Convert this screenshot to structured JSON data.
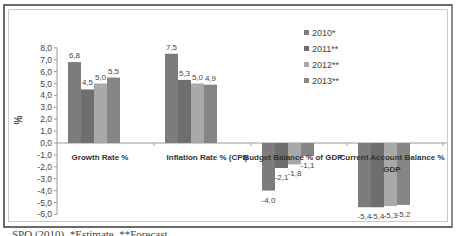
{
  "chart_data": {
    "type": "bar",
    "title": "",
    "xlabel": "",
    "ylabel": "%",
    "ylim": [
      -6.0,
      8.0
    ],
    "y_ticks": [
      "8,0",
      "7,0",
      "6,0",
      "5,0",
      "4,0",
      "3,0",
      "2,0",
      "1,0",
      "0,0",
      "-1,0",
      "-2,0",
      "-3,0",
      "-4,0",
      "-5,0",
      "-6,0"
    ],
    "categories": [
      "Growth Rate %",
      "Inflation Rate % (CPI)",
      "Budget Balance % of GDP",
      "Current Account Balance % GDP"
    ],
    "series": [
      {
        "name": "2010*",
        "color": "#7c7c7c",
        "values": [
          6.8,
          7.5,
          -4.0,
          -5.4
        ]
      },
      {
        "name": "2011**",
        "color": "#6e6e6e",
        "values": [
          4.5,
          5.3,
          -2.1,
          -5.4
        ]
      },
      {
        "name": "2012**",
        "color": "#a9a9a9",
        "values": [
          5.0,
          5.0,
          -1.8,
          -5.3
        ]
      },
      {
        "name": "2013**",
        "color": "#858585",
        "values": [
          5.5,
          4.9,
          -1.1,
          -5.2
        ]
      }
    ],
    "data_labels": [
      [
        "6,8",
        "4,5",
        "5,0",
        "5,5"
      ],
      [
        "7,5",
        "5,3",
        "5,0",
        "4,9"
      ],
      [
        "-4,0",
        "-2,1",
        "-1,8",
        "-1,1"
      ],
      [
        "-5,4",
        "-5,4",
        "-5,3",
        "-5,2"
      ]
    ],
    "legend_position": "top-right",
    "grid": false
  },
  "labels": {
    "categories": [
      "Growth Rate %",
      "Inflation Rate % (CPI)",
      "Budget Balance % of GDP",
      "Current Account Balance %",
      "GDP"
    ],
    "legend": [
      "2010*",
      "2011**",
      "2012**",
      "2013**"
    ],
    "y_axis_title": "%"
  },
  "caption": "SPO (2010), *Estimate, **Forecast"
}
